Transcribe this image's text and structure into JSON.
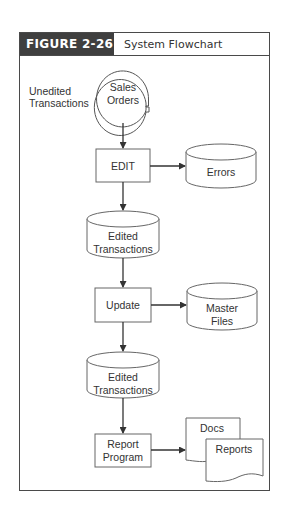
{
  "figure": {
    "label": "FIGURE 2-26",
    "title": "System Flowchart",
    "header_color": "#3f3f3f"
  },
  "input_label": {
    "line1": "Unedited",
    "line2": "Transactions"
  },
  "nodes": {
    "sales_orders": {
      "shape": "manual-input-circle",
      "line1": "Sales",
      "line2": "Orders"
    },
    "edit": {
      "shape": "process",
      "label": "EDIT"
    },
    "errors": {
      "shape": "disk-storage",
      "label": "Errors"
    },
    "edited_1": {
      "shape": "disk-storage",
      "line1": "Edited",
      "line2": "Transactions"
    },
    "update": {
      "shape": "process",
      "label": "Update"
    },
    "master_files": {
      "shape": "disk-storage",
      "line1": "Master",
      "line2": "Files"
    },
    "edited_2": {
      "shape": "disk-storage",
      "line1": "Edited",
      "line2": "Transactions"
    },
    "report_program": {
      "shape": "process",
      "line1": "Report",
      "line2": "Program"
    },
    "docs": {
      "shape": "document",
      "label": "Docs"
    },
    "reports": {
      "shape": "document",
      "label": "Reports"
    }
  },
  "edges": [
    {
      "from": "sales_orders",
      "to": "edit"
    },
    {
      "from": "edit",
      "to": "errors"
    },
    {
      "from": "edit",
      "to": "edited_1"
    },
    {
      "from": "edited_1",
      "to": "update"
    },
    {
      "from": "update",
      "to": "master_files"
    },
    {
      "from": "update",
      "to": "edited_2"
    },
    {
      "from": "edited_2",
      "to": "report_program"
    },
    {
      "from": "report_program",
      "to": "docs"
    }
  ]
}
